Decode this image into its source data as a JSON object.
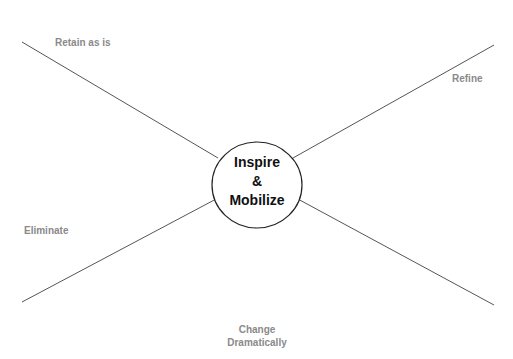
{
  "center": {
    "line1": "Inspire",
    "line2": "&",
    "line3": "Mobilize"
  },
  "quadrants": {
    "top_left": "Retain as is",
    "top_right": "Refine",
    "left": "Eliminate",
    "bottom_line1": "Change",
    "bottom_line2": "Dramatically"
  },
  "colors": {
    "line": "#555555",
    "label": "#8a8a8a",
    "center_text": "#111111",
    "ellipse_stroke": "#222222"
  }
}
